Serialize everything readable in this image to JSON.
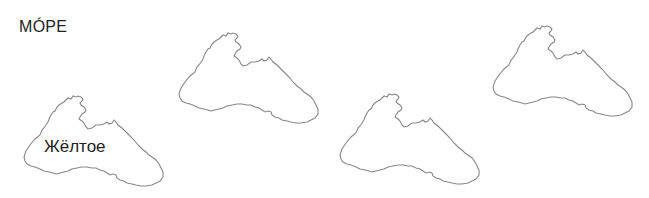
{
  "title": "МÓРЕ",
  "shapes": [
    {
      "name": "sea-outline-1",
      "label": "Жёлтое"
    },
    {
      "name": "sea-outline-2",
      "label": ""
    },
    {
      "name": "sea-outline-3",
      "label": ""
    },
    {
      "name": "sea-outline-4",
      "label": ""
    }
  ],
  "colors": {
    "outline": "#888888",
    "text": "#222222"
  }
}
